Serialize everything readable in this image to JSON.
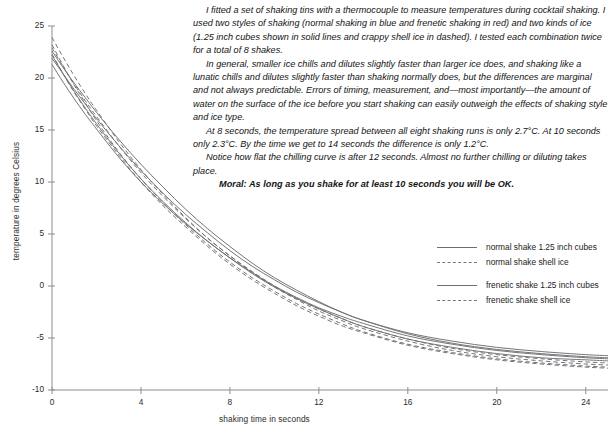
{
  "article": {
    "paragraphs": [
      "I fitted a set of shaking tins with a thermocouple to measure temperatures during cocktail shaking. I used two styles of shaking (normal shaking in blue and frenetic shaking in red) and two kinds of ice (1.25 inch cubes shown in solid lines and crappy shell ice in dashed). I tested each combination twice for a total of 8 shakes.",
      "In general, smaller ice chills and dilutes slightly faster than larger ice does, and shaking like a lunatic chills and dilutes slightly faster than shaking normally does, but the differences are marginal and not always predictable. Errors of timing, measurement, and—most importantly—the amount of water on the surface of the ice before you start shaking can easily outweigh the effects of shaking style and ice type.",
      "At 8 seconds, the temperature spread between all eight shaking runs is only 2.7°C. At 10 seconds only 2.3°C. By the time we get to 14 seconds the difference is only 1.2°C.",
      "Notice how flat the chilling curve is after 12 seconds. Almost no further chilling or diluting takes place."
    ],
    "moral": "Moral: As long as you shake for at least 10 seconds you will be OK."
  },
  "legend": {
    "entries": [
      {
        "label": "normal shake 1.25 inch cubes",
        "style": "solid"
      },
      {
        "label": "normal shake shell ice",
        "style": "dashed"
      },
      {
        "label": "frenetic shake 1.25 inch cubes",
        "style": "solid"
      },
      {
        "label": "frenetic shake shell ice",
        "style": "dashed"
      }
    ]
  },
  "chart_data": {
    "type": "line",
    "title": "",
    "xlabel": "shaking time in seconds",
    "ylabel": "temperature in degrees Celsius",
    "xlim": [
      0,
      25
    ],
    "ylim": [
      -10,
      25
    ],
    "xticks": [
      0,
      4,
      8,
      12,
      16,
      20,
      24
    ],
    "yticks": [
      -10,
      -5,
      0,
      5,
      10,
      15,
      20,
      25
    ],
    "grid": false,
    "legend_position": "right",
    "line_color": "#6e6e72",
    "x": [
      0,
      0.5,
      1,
      1.5,
      2,
      3,
      4,
      5,
      6,
      7,
      8,
      9,
      10,
      11,
      12,
      13,
      14,
      16,
      18,
      20,
      22,
      24,
      25
    ],
    "series": [
      {
        "name": "normal shake 1.25 inch cubes",
        "style": "solid",
        "values": [
          21.9,
          20.4,
          18.9,
          17.5,
          16.1,
          13.5,
          11.1,
          8.9,
          6.9,
          5.1,
          3.4,
          1.9,
          0.6,
          -0.6,
          -1.6,
          -2.5,
          -3.3,
          -4.5,
          -5.3,
          -5.9,
          -6.3,
          -6.6,
          -6.7
        ]
      },
      {
        "name": "normal shake 1.25 inch cubes (run 2)",
        "style": "solid",
        "values": [
          22.6,
          21.0,
          19.5,
          18.1,
          16.7,
          14.1,
          11.7,
          9.5,
          7.4,
          5.5,
          3.8,
          2.2,
          0.8,
          -0.4,
          -1.5,
          -2.5,
          -3.3,
          -4.6,
          -5.5,
          -6.1,
          -6.5,
          -6.8,
          -6.9
        ]
      },
      {
        "name": "normal shake shell ice",
        "style": "dashed",
        "values": [
          23.9,
          22.0,
          20.2,
          18.5,
          16.9,
          13.9,
          11.2,
          8.8,
          6.6,
          4.6,
          2.9,
          1.3,
          -0.1,
          -1.3,
          -2.4,
          -3.3,
          -4.1,
          -5.3,
          -6.2,
          -6.8,
          -7.2,
          -7.5,
          -7.6
        ]
      },
      {
        "name": "normal shake shell ice (run 2)",
        "style": "dashed",
        "values": [
          22.9,
          21.1,
          19.4,
          17.8,
          16.3,
          13.5,
          10.9,
          8.6,
          6.5,
          4.6,
          2.9,
          1.4,
          0.0,
          -1.2,
          -2.2,
          -3.1,
          -3.9,
          -5.1,
          -6.0,
          -6.6,
          -7.0,
          -7.3,
          -7.4
        ]
      },
      {
        "name": "frenetic shake 1.25 inch cubes",
        "style": "solid",
        "values": [
          21.3,
          19.6,
          18.0,
          16.5,
          15.1,
          12.4,
          10.0,
          7.9,
          6.0,
          4.3,
          2.7,
          1.3,
          0.0,
          -1.1,
          -2.1,
          -2.9,
          -3.6,
          -4.8,
          -5.6,
          -6.2,
          -6.6,
          -6.9,
          -7.0
        ]
      },
      {
        "name": "frenetic shake 1.25 inch cubes (run 2)",
        "style": "solid",
        "values": [
          22.2,
          20.4,
          18.7,
          17.1,
          15.6,
          12.8,
          10.3,
          8.1,
          6.1,
          4.3,
          2.7,
          1.2,
          -0.1,
          -1.2,
          -2.2,
          -3.1,
          -3.9,
          -5.1,
          -5.9,
          -6.5,
          -6.9,
          -7.1,
          -7.2
        ]
      },
      {
        "name": "frenetic shake shell ice",
        "style": "dashed",
        "values": [
          23.2,
          21.2,
          19.3,
          17.6,
          15.9,
          12.9,
          10.3,
          8.0,
          5.9,
          4.0,
          2.3,
          0.8,
          -0.5,
          -1.7,
          -2.7,
          -3.6,
          -4.4,
          -5.6,
          -6.4,
          -7.0,
          -7.4,
          -7.7,
          -7.8
        ]
      },
      {
        "name": "frenetic shake shell ice (run 2)",
        "style": "dashed",
        "values": [
          22.3,
          20.4,
          18.6,
          17.0,
          15.4,
          12.6,
          10.0,
          7.7,
          5.7,
          3.8,
          2.1,
          0.6,
          -0.7,
          -1.9,
          -2.9,
          -3.8,
          -4.5,
          -5.7,
          -6.5,
          -7.1,
          -7.5,
          -7.8,
          -7.9
        ]
      }
    ]
  }
}
